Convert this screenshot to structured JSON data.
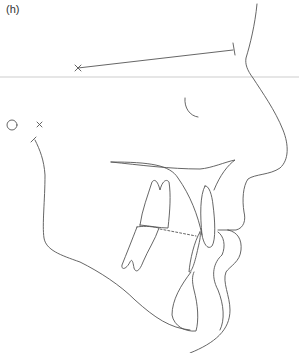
{
  "figure": {
    "panel_label": "(h)",
    "stroke_color": "#555555",
    "reference_line_color": "#e6e6e6",
    "background": "#ffffff"
  }
}
